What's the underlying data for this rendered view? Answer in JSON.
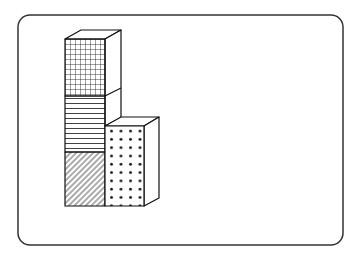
{
  "diagram": {
    "frame": {
      "x": 18,
      "y": 15,
      "width": 325,
      "height": 230,
      "radius": 12,
      "stroke": "#333333"
    },
    "tall_column": {
      "segments": [
        {
          "name": "top",
          "pattern": "grid",
          "y_top": 39,
          "y_bottom": 96
        },
        {
          "name": "middle",
          "pattern": "horizontal-lines",
          "y_top": 96,
          "y_bottom": 152
        },
        {
          "name": "bottom",
          "pattern": "diagonal-hatch",
          "y_top": 152,
          "y_bottom": 206
        }
      ]
    },
    "short_column": {
      "pattern": "dots",
      "y_top": 126,
      "y_bottom": 206
    },
    "colors": {
      "stroke": "#111111",
      "fill": "#ffffff"
    }
  }
}
